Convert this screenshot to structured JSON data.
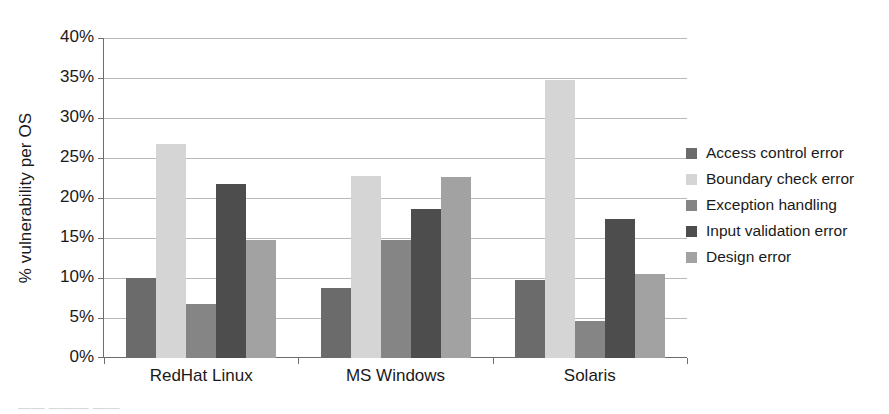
{
  "chart_data": {
    "type": "bar",
    "title": "",
    "xlabel": "",
    "ylabel": "% vulnerability per OS",
    "categories": [
      "RedHat Linux",
      "MS Windows",
      "Solaris"
    ],
    "ylim": [
      0,
      40
    ],
    "ytick_labels": [
      "0%",
      "5%",
      "10%",
      "15%",
      "20%",
      "25%",
      "30%",
      "35%",
      "40%"
    ],
    "ytick_values": [
      0,
      5,
      10,
      15,
      20,
      25,
      30,
      35,
      40
    ],
    "grid": true,
    "legend_position": "right",
    "series": [
      {
        "name": "Access control error",
        "color": "#6b6b6b",
        "values": [
          10.0,
          8.7,
          9.7
        ]
      },
      {
        "name": "Boundary check error",
        "color": "#d5d5d5",
        "values": [
          26.8,
          22.7,
          34.7
        ]
      },
      {
        "name": "Exception handling",
        "color": "#858585",
        "values": [
          6.8,
          14.8,
          4.6
        ]
      },
      {
        "name": "Input validation error",
        "color": "#4d4d4d",
        "values": [
          21.7,
          18.6,
          17.4
        ]
      },
      {
        "name": "Design error",
        "color": "#a2a2a2",
        "values": [
          14.8,
          22.6,
          10.5
        ]
      }
    ]
  },
  "caption_fragment": "—— ——— ——"
}
